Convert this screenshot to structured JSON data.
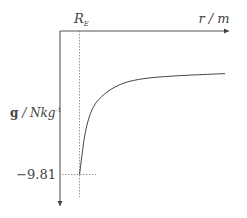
{
  "chart_data": {
    "type": "line",
    "title": "",
    "xlabel": "r / m",
    "ylabel_bold": "g",
    "ylabel_rest": " / Nkg",
    "ylabel_exp": "-1",
    "x_marker_label": "R",
    "x_marker_sub": "E",
    "y_marker_label": "−9.81",
    "y_marker_value": -9.81,
    "series": [
      {
        "name": "g vs r",
        "description": "g = -9.81 at r = R_E, approaching 0 asymptotically as r increases",
        "relative_points": [
          [
            1.0,
            -9.81
          ],
          [
            1.3,
            -5.8
          ],
          [
            1.7,
            -3.4
          ],
          [
            2.3,
            -2.1
          ],
          [
            3.1,
            -1.2
          ],
          [
            4.1,
            -0.7
          ],
          [
            5.7,
            -0.4
          ],
          [
            8.5,
            -0.15
          ]
        ]
      }
    ],
    "grid": false,
    "colors": {
      "axis": "#555555",
      "curve": "#444444",
      "guide": "#777777"
    }
  }
}
